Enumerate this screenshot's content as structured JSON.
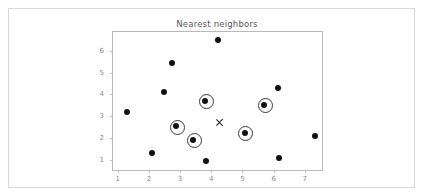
{
  "figure": {
    "background_color": "#ffffff",
    "border_color": "#d8d8d8"
  },
  "chart_data": {
    "type": "scatter",
    "title": "Nearest neighbors",
    "xlabel": "",
    "ylabel": "",
    "xlim": [
      0.85,
      7.55
    ],
    "ylim": [
      0.55,
      6.85
    ],
    "xticks": [
      1,
      2,
      3,
      4,
      5,
      6,
      7
    ],
    "yticks": [
      1,
      2,
      3,
      4,
      5,
      6
    ],
    "xtick_labels": [
      "1",
      "2",
      "3",
      "4",
      "5",
      "6",
      "7"
    ],
    "ytick_labels": [
      "1",
      "2",
      "3",
      "4",
      "5",
      "6"
    ],
    "grid": false,
    "legend": null,
    "series": [
      {
        "name": "data points",
        "marker": "filled-circle",
        "color": "#111111",
        "points": [
          {
            "x": 1.3,
            "y": 3.2,
            "highlighted": false
          },
          {
            "x": 2.1,
            "y": 1.34,
            "highlighted": false
          },
          {
            "x": 2.48,
            "y": 4.12,
            "highlighted": false
          },
          {
            "x": 2.73,
            "y": 5.43,
            "highlighted": false
          },
          {
            "x": 2.88,
            "y": 2.54,
            "highlighted": true
          },
          {
            "x": 3.42,
            "y": 1.93,
            "highlighted": true
          },
          {
            "x": 3.8,
            "y": 3.72,
            "highlighted": true
          },
          {
            "x": 3.83,
            "y": 0.94,
            "highlighted": false
          },
          {
            "x": 4.2,
            "y": 6.5,
            "highlighted": false
          },
          {
            "x": 5.07,
            "y": 2.24,
            "highlighted": true
          },
          {
            "x": 5.7,
            "y": 3.52,
            "highlighted": true
          },
          {
            "x": 6.13,
            "y": 4.31,
            "highlighted": false
          },
          {
            "x": 6.17,
            "y": 1.12,
            "highlighted": false
          },
          {
            "x": 7.33,
            "y": 2.12,
            "highlighted": false
          }
        ]
      },
      {
        "name": "query point",
        "marker": "x",
        "color": "#1a1a1a",
        "points": [
          {
            "x": 4.26,
            "y": 2.7,
            "highlighted": false
          }
        ]
      }
    ],
    "highlight_style": {
      "name": "neighbor-ring",
      "marker": "open-circle",
      "color": "#3a3a3a"
    }
  }
}
